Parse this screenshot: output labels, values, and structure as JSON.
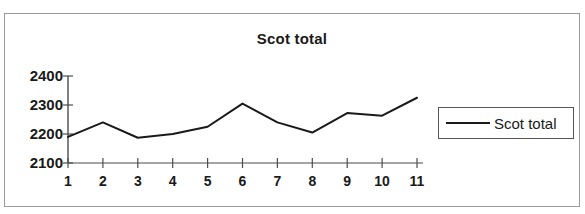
{
  "chart_data": {
    "type": "line",
    "title": "Scot total",
    "xlabel": "",
    "ylabel": "",
    "x": [
      1,
      2,
      3,
      4,
      5,
      6,
      7,
      8,
      9,
      10,
      11
    ],
    "categories": [
      "1",
      "2",
      "3",
      "4",
      "5",
      "6",
      "7",
      "8",
      "9",
      "10",
      "11"
    ],
    "series": [
      {
        "name": "Scot total",
        "values": [
          2190,
          2240,
          2187,
          2200,
          2225,
          2305,
          2240,
          2205,
          2272,
          2263,
          2325
        ],
        "color": "#1a1a1a"
      }
    ],
    "ylim": [
      2100,
      2400
    ],
    "yticks": [
      2100,
      2200,
      2300,
      2400
    ],
    "ytick_labels": [
      "2100",
      "2200",
      "2300",
      "2400"
    ],
    "xlim": [
      1,
      11
    ],
    "grid": false,
    "legend": {
      "position": "right",
      "entries": [
        {
          "label": "Scot total",
          "color": "#1a1a1a"
        }
      ]
    },
    "axis_color": "#4d4d4d",
    "border_color": "#9a9a9a"
  }
}
